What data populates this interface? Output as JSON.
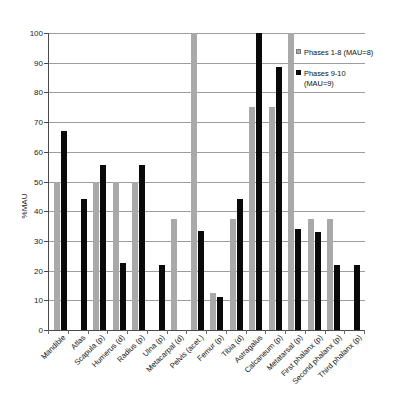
{
  "figure": {
    "top_faint_text": "· · · · · · · · ·",
    "axis_label_y": "%MAU"
  },
  "legend": {
    "position": "top-right-inside",
    "entries": [
      {
        "name": "series-1-swatch",
        "label": "Phases 1-8 (MAU=8)",
        "color": "#a9a9a9"
      },
      {
        "name": "series-2-swatch",
        "label": "Phases 9-10\n(MAU=9)",
        "color": "#0a0a0a"
      }
    ]
  },
  "chart_data": {
    "type": "bar",
    "title": "",
    "subtitle": "",
    "xlabel": "",
    "ylabel": "%MAU",
    "ylim": [
      0,
      100
    ],
    "yticks": [
      0,
      10,
      20,
      30,
      40,
      50,
      60,
      70,
      80,
      90,
      100
    ],
    "ytick_labels": [
      "0",
      "10",
      "20",
      "30",
      "40",
      "50",
      "60",
      "70",
      "80",
      "90",
      "100"
    ],
    "grid": true,
    "grid_axis": "y",
    "legend_position": "upper right",
    "categories": [
      "Mandible",
      "Atlas",
      "Scapula (p)",
      "Humerus (d)",
      "Radius (p)",
      "Ulna (p)",
      "Metacarpal (d)",
      "Pelvis (acet.)",
      "Femur (p)",
      "Tibia (d)",
      "Astragalus",
      "Calcaneum (p)",
      "Metatarsal (p)",
      "First phalanx (p)",
      "Second phalanx (p)",
      "Third phalanx (p)"
    ],
    "series": [
      {
        "name": "Phases 1-8 (MAU=8)",
        "color": "#a9a9a9",
        "values": [
          50,
          0,
          50,
          50,
          50,
          0,
          37.5,
          100,
          12.5,
          37.5,
          75,
          75,
          100,
          37.5,
          37.5,
          0
        ]
      },
      {
        "name": "Phases 9-10 (MAU=9)",
        "color": "#0a0a0a",
        "values": [
          67,
          44,
          55.5,
          22.5,
          55.5,
          22,
          0,
          33.5,
          11,
          44,
          100,
          88.5,
          34,
          33,
          22,
          22
        ]
      }
    ]
  }
}
